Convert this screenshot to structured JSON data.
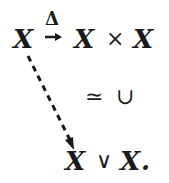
{
  "diagram": {
    "source": "X",
    "arrow_label": "Δ",
    "target": "X",
    "product_op": "×",
    "target2": "X",
    "middle": {
      "iso": "≃",
      "union": "∪"
    },
    "bottom": {
      "left": "X",
      "op": "∨",
      "right": "X",
      "period": "."
    }
  }
}
